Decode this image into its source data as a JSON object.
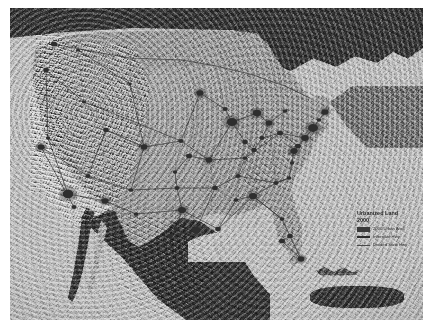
{
  "map": {
    "title": "Urbanized Land",
    "year": "2000",
    "subject": "Contiguous United States urbanized land with interstate and state highway network over shaded relief",
    "projection_note": "",
    "background_color": "#ffffff",
    "ocean_color": "#bcbcbc",
    "us_land_color": "#9a9a9a",
    "foreign_land_color": "#3c3c3c",
    "urban_color": "#2e2e2e",
    "highway_color": "#3a3a3a"
  },
  "legend": {
    "title_line1": "Urbanized Land",
    "title_line2": "2000",
    "entries": [
      {
        "symbol": "area",
        "label": "2000 Urban Area",
        "color": "#3a3a3a"
      },
      {
        "symbol": "line1",
        "label": "Interstate Hwy",
        "color": "#2b2b2b"
      },
      {
        "symbol": "line2",
        "label": "Divided State Hwy",
        "color": "#4a4a4a"
      }
    ]
  },
  "urban_areas": [
    {
      "name": "los-angeles",
      "x": 58,
      "y": 186,
      "r": 5.4
    },
    {
      "name": "san-francisco",
      "x": 31,
      "y": 139,
      "r": 3.6
    },
    {
      "name": "san-diego",
      "x": 64,
      "y": 199,
      "r": 2.6
    },
    {
      "name": "sacramento",
      "x": 38,
      "y": 130,
      "r": 2.2
    },
    {
      "name": "las-vegas",
      "x": 78,
      "y": 168,
      "r": 2.6
    },
    {
      "name": "phoenix",
      "x": 95,
      "y": 193,
      "r": 3.6
    },
    {
      "name": "tucson",
      "x": 104,
      "y": 205,
      "r": 2.2
    },
    {
      "name": "salt-lake-city",
      "x": 96,
      "y": 122,
      "r": 2.8
    },
    {
      "name": "boise",
      "x": 74,
      "y": 94,
      "r": 2.0
    },
    {
      "name": "portland",
      "x": 36,
      "y": 62,
      "r": 2.8
    },
    {
      "name": "seattle",
      "x": 44,
      "y": 36,
      "r": 3.2
    },
    {
      "name": "spokane",
      "x": 68,
      "y": 42,
      "r": 2.0
    },
    {
      "name": "denver",
      "x": 134,
      "y": 139,
      "r": 3.4
    },
    {
      "name": "albuquerque",
      "x": 121,
      "y": 182,
      "r": 2.4
    },
    {
      "name": "el-paso",
      "x": 126,
      "y": 206,
      "r": 2.4
    },
    {
      "name": "billings",
      "x": 120,
      "y": 76,
      "r": 1.8
    },
    {
      "name": "minneapolis",
      "x": 190,
      "y": 85,
      "r": 3.6
    },
    {
      "name": "omaha",
      "x": 171,
      "y": 133,
      "r": 2.6
    },
    {
      "name": "kansas-city",
      "x": 179,
      "y": 148,
      "r": 3.0
    },
    {
      "name": "wichita",
      "x": 165,
      "y": 164,
      "r": 2.2
    },
    {
      "name": "oklahoma-city",
      "x": 167,
      "y": 180,
      "r": 2.6
    },
    {
      "name": "dallas",
      "x": 172,
      "y": 202,
      "r": 4.0
    },
    {
      "name": "austin",
      "x": 166,
      "y": 221,
      "r": 2.4
    },
    {
      "name": "san-antonio",
      "x": 160,
      "y": 228,
      "r": 2.8
    },
    {
      "name": "houston",
      "x": 186,
      "y": 222,
      "r": 4.0
    },
    {
      "name": "new-orleans",
      "x": 208,
      "y": 221,
      "r": 2.8
    },
    {
      "name": "memphis",
      "x": 205,
      "y": 180,
      "r": 2.8
    },
    {
      "name": "st-louis",
      "x": 199,
      "y": 152,
      "r": 3.4
    },
    {
      "name": "chicago",
      "x": 222,
      "y": 114,
      "r": 5.2
    },
    {
      "name": "milwaukee",
      "x": 215,
      "y": 101,
      "r": 2.6
    },
    {
      "name": "indianapolis",
      "x": 235,
      "y": 134,
      "r": 2.8
    },
    {
      "name": "detroit",
      "x": 247,
      "y": 105,
      "r": 4.2
    },
    {
      "name": "cleveland",
      "x": 259,
      "y": 115,
      "r": 3.4
    },
    {
      "name": "columbus",
      "x": 252,
      "y": 130,
      "r": 2.6
    },
    {
      "name": "cincinnati",
      "x": 244,
      "y": 142,
      "r": 2.8
    },
    {
      "name": "louisville",
      "x": 235,
      "y": 150,
      "r": 2.4
    },
    {
      "name": "nashville",
      "x": 228,
      "y": 168,
      "r": 2.6
    },
    {
      "name": "birmingham",
      "x": 226,
      "y": 192,
      "r": 2.4
    },
    {
      "name": "atlanta",
      "x": 243,
      "y": 188,
      "r": 4.0
    },
    {
      "name": "pittsburgh",
      "x": 270,
      "y": 125,
      "r": 3.0
    },
    {
      "name": "buffalo",
      "x": 275,
      "y": 103,
      "r": 2.4
    },
    {
      "name": "washington-dc",
      "x": 284,
      "y": 143,
      "r": 3.8
    },
    {
      "name": "baltimore",
      "x": 288,
      "y": 138,
      "r": 3.0
    },
    {
      "name": "philadelphia",
      "x": 295,
      "y": 130,
      "r": 3.8
    },
    {
      "name": "new-york",
      "x": 303,
      "y": 120,
      "r": 5.0
    },
    {
      "name": "hartford",
      "x": 309,
      "y": 112,
      "r": 2.2
    },
    {
      "name": "boston",
      "x": 315,
      "y": 104,
      "r": 3.6
    },
    {
      "name": "richmond",
      "x": 282,
      "y": 155,
      "r": 2.2
    },
    {
      "name": "raleigh",
      "x": 279,
      "y": 170,
      "r": 2.4
    },
    {
      "name": "charlotte",
      "x": 266,
      "y": 175,
      "r": 2.6
    },
    {
      "name": "jacksonville",
      "x": 272,
      "y": 211,
      "r": 2.4
    },
    {
      "name": "orlando",
      "x": 280,
      "y": 228,
      "r": 2.8
    },
    {
      "name": "tampa",
      "x": 272,
      "y": 233,
      "r": 3.0
    },
    {
      "name": "miami",
      "x": 291,
      "y": 251,
      "r": 3.4
    }
  ],
  "place_counts": {
    "urban_area_count": 55
  }
}
